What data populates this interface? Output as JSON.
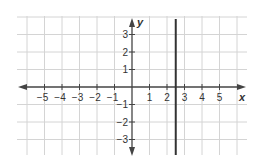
{
  "chart_data": {
    "type": "line",
    "title": "",
    "xlabel": "x",
    "ylabel": "y",
    "xlim": [
      -6.5,
      6.5
    ],
    "ylim": [
      -4,
      4
    ],
    "grid": true,
    "x_ticks": [
      -5,
      -4,
      -3,
      -2,
      -1,
      1,
      2,
      3,
      4,
      5
    ],
    "y_ticks": [
      -3,
      -2,
      -1,
      1,
      2,
      3
    ],
    "x_tick_labels": [
      "−5",
      "−4",
      "−3",
      "−2",
      "−1",
      "1",
      "2",
      "3",
      "4",
      "5"
    ],
    "y_tick_labels": [
      "−3",
      "−2",
      "−1",
      "1",
      "2",
      "3"
    ],
    "series": [
      {
        "name": "vertical line x = 2.5",
        "kind": "vertical_line",
        "x": 2.5,
        "y_range": [
          -4,
          4
        ],
        "color": "#333333"
      }
    ]
  },
  "colors": {
    "grid": "#d4d4d4",
    "axis": "#444444",
    "line": "#333333"
  }
}
